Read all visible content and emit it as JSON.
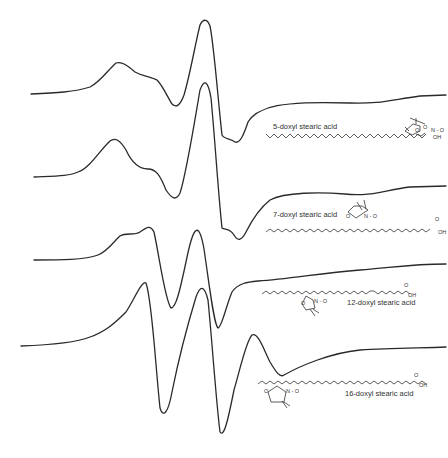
{
  "figure": {
    "type": "EPR spectra of doxyl stearic acid spin labels",
    "traces": [
      {
        "label": "5-doxyl stearic acid",
        "atoms": {
          "o_ring": "O",
          "n_o": "N - O",
          "carbonyl_o": "O",
          "oh": "OH"
        }
      },
      {
        "label": "7-doxyl stearic acid",
        "atoms": {
          "o_ring": "O",
          "n_o": "N - O",
          "carbonyl_o": "O",
          "oh": "OH"
        }
      },
      {
        "label": "12-doxyl stearic acid",
        "atoms": {
          "o_ring": "O",
          "n_o": "N - O",
          "carbonyl_o": "O",
          "oh": "OH"
        }
      },
      {
        "label": "16-doxyl stearic acid",
        "atoms": {
          "o_ring": "O",
          "n_o": "N - O",
          "carbonyl_o": "O",
          "oh": "OH"
        }
      }
    ],
    "line_color": "#2a2a2a",
    "background": "#ffffff"
  }
}
